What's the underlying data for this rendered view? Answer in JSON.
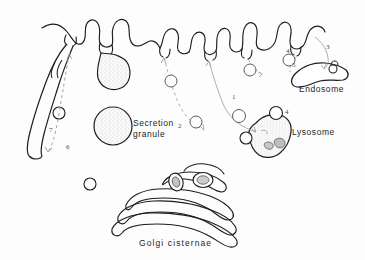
{
  "figure": {
    "background_color": "#fdfdfd",
    "ink_color": "#1d1d1d"
  },
  "labels": {
    "endosome": "Endosome",
    "lysosome": "Lysosome",
    "secretion_granule": "Secretion\ngranule",
    "golgi_cisternae": "Golgi cisternae"
  },
  "pathway_numbers": [
    {
      "id": "1",
      "label": "1",
      "x": 232,
      "y": 93
    },
    {
      "id": "2",
      "label": "2",
      "x": 178,
      "y": 122
    },
    {
      "id": "3",
      "label": "3",
      "x": 326,
      "y": 43
    },
    {
      "id": "4a",
      "label": "4",
      "x": 286,
      "y": 47
    },
    {
      "id": "4b",
      "label": "4",
      "x": 285,
      "y": 108
    },
    {
      "id": "5",
      "label": "5",
      "x": 292,
      "y": 61
    },
    {
      "id": "6",
      "label": "6",
      "x": 66,
      "y": 143
    },
    {
      "id": "7",
      "label": "7",
      "x": 49,
      "y": 126
    }
  ],
  "structures": {
    "plasma_membrane": "wavy apical plasma membrane with microvilli and coated pits",
    "secretion_granule_fusing": "stippled granule fusing with plasma membrane",
    "free_secretion_granule": "stippled round secretion granule",
    "endosome": "elongated tubular endosome",
    "lysosome": "irregular dense lysosome with inclusions",
    "golgi": "stack of flattened Golgi cisternae",
    "cell_process": "elongated lateral cell process containing a vesicle",
    "coated_vesicles": "small circular transport vesicles along arrows"
  }
}
